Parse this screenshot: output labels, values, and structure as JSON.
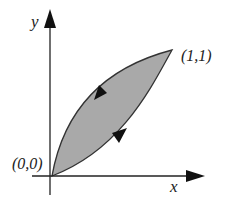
{
  "diagram": {
    "axes": {
      "x_label": "x",
      "y_label": "y"
    },
    "points": {
      "origin_label": "(0,0)",
      "end_label": "(1,1)"
    },
    "region": {
      "fill_color": "#a9a9a9",
      "stroke_color": "#333333",
      "upper_curve_direction": "toward origin",
      "lower_curve_direction": "toward (1,1)"
    }
  }
}
